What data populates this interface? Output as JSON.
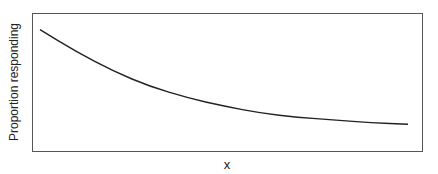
{
  "chart_data": {
    "type": "line",
    "title": "",
    "xlabel": "x",
    "ylabel": "Proportion responding",
    "x_ticks": [],
    "y_ticks": [],
    "grid": false,
    "legend": null,
    "series": [
      {
        "name": "response curve",
        "shape": "decreasing exponential decay approaching an asymptote",
        "x": [
          0,
          0.1,
          0.2,
          0.3,
          0.4,
          0.5,
          0.6,
          0.7,
          0.8,
          0.9,
          1.0
        ],
        "values": [
          0.88,
          0.72,
          0.58,
          0.47,
          0.39,
          0.33,
          0.28,
          0.25,
          0.23,
          0.21,
          0.2
        ]
      }
    ],
    "xlim": [
      0,
      1
    ],
    "ylim": [
      0,
      1
    ]
  },
  "axes": {
    "x_label": "x",
    "y_label": "Proportion responding"
  },
  "colors": {
    "line": "#222222",
    "frame": "#555555",
    "background": "#ffffff"
  }
}
